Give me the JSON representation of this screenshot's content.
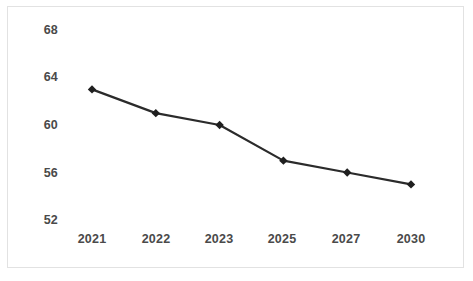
{
  "chart_data": {
    "type": "line",
    "title": "",
    "subtitle": "",
    "xlabel": "",
    "ylabel": "",
    "categories": [
      "2021",
      "2022",
      "2023",
      "2025",
      "2027",
      "2030"
    ],
    "values": [
      63,
      61,
      60,
      57,
      56,
      55
    ],
    "series": [
      {
        "name": "",
        "values": [
          63,
          61,
          60,
          57,
          56,
          55
        ]
      }
    ],
    "x_tick_labels": [
      "2021",
      "2022",
      "2023",
      "2025",
      "2027",
      "2030"
    ],
    "y_tick_labels": [
      "68",
      "64",
      "60",
      "56",
      "52"
    ],
    "y_ticks": [
      68,
      64,
      60,
      56,
      52
    ],
    "ylim": [
      52,
      68
    ],
    "grid": false,
    "legend": false,
    "legend_position": "none",
    "marker": "diamond",
    "line_color": "#2b2b2b",
    "marker_color": "#1f1f1f",
    "frame_color": "#e2e2e2",
    "background_color": "#ffffff",
    "tick_label_color": "#4a4a4a",
    "annotations": []
  }
}
